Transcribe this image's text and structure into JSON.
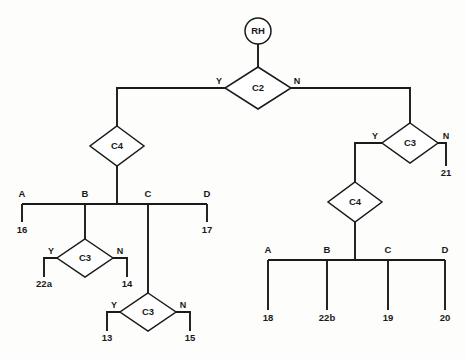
{
  "diagram": {
    "colors": {
      "background": "#fdfdfb",
      "stroke": "#1a1a1a",
      "node_fill": "#ffffff"
    },
    "start_node": {
      "id": "start-rh",
      "label": "RH",
      "shape": "circle",
      "cx": 258,
      "cy": 31,
      "r": 13
    },
    "decision_nodes": [
      {
        "id": "c2",
        "label": "C2",
        "cx": 258,
        "cy": 88,
        "rx": 33,
        "ry": 21
      },
      {
        "id": "c4-left",
        "label": "C4",
        "cx": 117,
        "cy": 146,
        "rx": 27,
        "ry": 20
      },
      {
        "id": "c3-left-upper",
        "label": "C3",
        "cx": 85,
        "cy": 258,
        "rx": 28,
        "ry": 19
      },
      {
        "id": "c3-left-lower",
        "label": "C3",
        "cx": 148,
        "cy": 312,
        "rx": 28,
        "ry": 19
      },
      {
        "id": "c3-right",
        "label": "C3",
        "cx": 410,
        "cy": 143,
        "rx": 28,
        "ry": 20
      },
      {
        "id": "c4-right",
        "label": "C4",
        "cx": 355,
        "cy": 202,
        "rx": 27,
        "ry": 20
      }
    ],
    "branch_labels": [
      {
        "id": "c2-yes",
        "text": "Y",
        "x": 219,
        "y": 84
      },
      {
        "id": "c2-no",
        "text": "N",
        "x": 297,
        "y": 84
      },
      {
        "id": "c3-left-upper-yes",
        "text": "Y",
        "x": 51,
        "y": 254
      },
      {
        "id": "c3-left-upper-no",
        "text": "N",
        "x": 120,
        "y": 254
      },
      {
        "id": "c3-left-lower-yes",
        "text": "Y",
        "x": 114,
        "y": 308
      },
      {
        "id": "c3-left-lower-no",
        "text": "N",
        "x": 183,
        "y": 308
      },
      {
        "id": "c3-right-yes",
        "text": "Y",
        "x": 375,
        "y": 139
      },
      {
        "id": "c3-right-no",
        "text": "N",
        "x": 446,
        "y": 139
      }
    ],
    "bus_left": {
      "id": "bus-left",
      "y": 204,
      "x_start": 22,
      "x_end": 207,
      "ports": [
        {
          "id": "left-port-a",
          "label": "A",
          "x": 22,
          "label_y": 197,
          "drop_to": 222,
          "terminal": "16",
          "terminal_y": 233
        },
        {
          "id": "left-port-b",
          "label": "B",
          "x": 85,
          "label_y": 197,
          "drop_to": 239,
          "terminal": null,
          "terminal_y": null
        },
        {
          "id": "left-port-c",
          "label": "C",
          "x": 148,
          "label_y": 197,
          "drop_to": 293,
          "terminal": null,
          "terminal_y": null
        },
        {
          "id": "left-port-d",
          "label": "D",
          "x": 207,
          "label_y": 197,
          "drop_to": 222,
          "terminal": "17",
          "terminal_y": 233
        }
      ]
    },
    "bus_right": {
      "id": "bus-right",
      "y": 260,
      "x_start": 268,
      "x_end": 445,
      "ports": [
        {
          "id": "right-port-a",
          "label": "A",
          "x": 268,
          "label_y": 253,
          "drop_to": 310,
          "terminal": "18",
          "terminal_y": 321
        },
        {
          "id": "right-port-b",
          "label": "B",
          "x": 327,
          "label_y": 253,
          "drop_to": 310,
          "terminal": "22b",
          "terminal_y": 321
        },
        {
          "id": "right-port-c",
          "label": "C",
          "x": 388,
          "label_y": 253,
          "drop_to": 310,
          "terminal": "19",
          "terminal_y": 321
        },
        {
          "id": "right-port-d",
          "label": "D",
          "x": 445,
          "label_y": 253,
          "drop_to": 310,
          "terminal": "20",
          "terminal_y": 321
        }
      ]
    },
    "terminals": [
      {
        "id": "terminal-16",
        "label": "16",
        "x": 22,
        "y": 233
      },
      {
        "id": "terminal-17",
        "label": "17",
        "x": 207,
        "y": 233
      },
      {
        "id": "terminal-22a",
        "label": "22a",
        "x": 44,
        "y": 287
      },
      {
        "id": "terminal-14",
        "label": "14",
        "x": 127,
        "y": 287
      },
      {
        "id": "terminal-13",
        "label": "13",
        "x": 107,
        "y": 341
      },
      {
        "id": "terminal-15",
        "label": "15",
        "x": 190,
        "y": 341
      },
      {
        "id": "terminal-21",
        "label": "21",
        "x": 446,
        "y": 176
      },
      {
        "id": "terminal-18",
        "label": "18",
        "x": 268,
        "y": 321
      },
      {
        "id": "terminal-22b",
        "label": "22b",
        "x": 327,
        "y": 321
      },
      {
        "id": "terminal-19",
        "label": "19",
        "x": 388,
        "y": 321
      },
      {
        "id": "terminal-20",
        "label": "20",
        "x": 445,
        "y": 321
      }
    ],
    "edges": [
      {
        "id": "edge-rh-to-c2",
        "d": "M 258 44 L 258 67"
      },
      {
        "id": "edge-c2-y-trunk",
        "d": "M 225 88 L 117 88 L 117 126"
      },
      {
        "id": "edge-c2-n-trunk",
        "d": "M 291 88 L 410 88 L 410 123"
      },
      {
        "id": "edge-c4left-to-bus",
        "d": "M 117 166 L 117 204"
      },
      {
        "id": "edge-bus-left",
        "d": "M 22 204 L 207 204"
      },
      {
        "id": "edge-left-a-drop",
        "d": "M 22 204 L 22 222"
      },
      {
        "id": "edge-left-b-drop",
        "d": "M 85 204 L 85 239"
      },
      {
        "id": "edge-left-c-drop",
        "d": "M 148 204 L 148 293"
      },
      {
        "id": "edge-left-d-drop",
        "d": "M 207 204 L 207 222"
      },
      {
        "id": "edge-c3lu-y",
        "d": "M 57 258 L 44 258 L 44 277"
      },
      {
        "id": "edge-c3lu-n",
        "d": "M 113 258 L 127 258 L 127 277"
      },
      {
        "id": "edge-c3ll-y",
        "d": "M 120 312 L 107 312 L 107 331"
      },
      {
        "id": "edge-c3ll-n",
        "d": "M 176 312 L 190 312 L 190 331"
      },
      {
        "id": "edge-c3right-y",
        "d": "M 382 143 L 355 143 L 355 182"
      },
      {
        "id": "edge-c3right-n",
        "d": "M 438 143 L 446 143 L 446 166"
      },
      {
        "id": "edge-c4right-to-bus",
        "d": "M 355 222 L 355 260"
      },
      {
        "id": "edge-bus-right",
        "d": "M 268 260 L 445 260"
      },
      {
        "id": "edge-right-a-drop",
        "d": "M 268 260 L 268 310"
      },
      {
        "id": "edge-right-b-drop",
        "d": "M 327 260 L 327 310"
      },
      {
        "id": "edge-right-c-drop",
        "d": "M 388 260 L 388 310"
      },
      {
        "id": "edge-right-d-drop",
        "d": "M 445 260 L 445 310"
      }
    ]
  }
}
